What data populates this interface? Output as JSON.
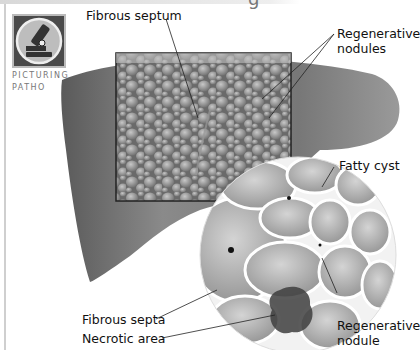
{
  "page": {
    "heading_fragment": "g",
    "badge": {
      "icon": "microscope-icon",
      "caption_line1": "PICTURING",
      "caption_line2": "PATHO"
    }
  },
  "figure": {
    "labels": {
      "fibrous_septum": "Fibrous septum",
      "regenerative_nodules_line1": "Regenerative",
      "regenerative_nodules_line2": "nodules",
      "fatty_cyst": "Fatty cyst",
      "fibrous_septa": "Fibrous septa",
      "necrotic_area": "Necrotic area",
      "regenerative_nodule_line1": "Regenerative",
      "regenerative_nodule_line2": "nodule"
    }
  }
}
